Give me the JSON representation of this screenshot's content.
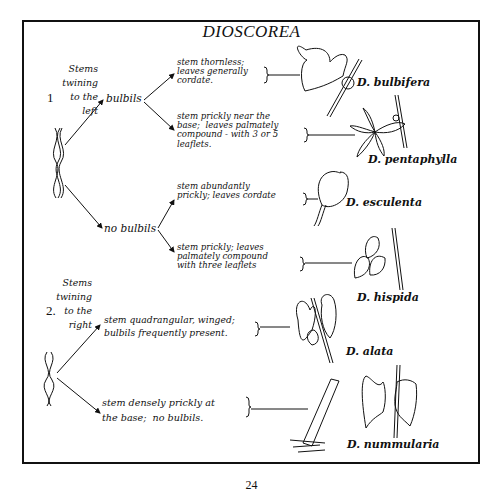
{
  "title": "DIOSCOREA",
  "page_number": "24",
  "groups": [
    {
      "number": "1",
      "heading": "Stems\ntwining\nto the\nleft",
      "branches": [
        {
          "node": "bulbils",
          "leaves": [
            {
              "description": "stem thornless;\nleaves generally\ncordate.",
              "species": "D. bulbifera"
            },
            {
              "description": "stem prickly near the\nbase;  leaves palmately\ncompound - with 3 or 5\nleaflets.",
              "species": "D. pentaphylla"
            }
          ]
        },
        {
          "node": "no bulbils",
          "leaves": [
            {
              "description": "stem abundantly\nprickly; leaves cordate",
              "species": "D. esculenta"
            },
            {
              "description": "stem prickly; leaves\npalmately compound\nwith three leaflets",
              "species": "D. hispida"
            }
          ]
        }
      ]
    },
    {
      "number": "2.",
      "heading": "Stems\ntwining\nto the\nright",
      "leaves": [
        {
          "description": "stem quadrangular, winged;\nbulbils frequently present.",
          "species": "D. alata"
        },
        {
          "description": "stem densely prickly at\nthe base;  no bulbils.",
          "species": "D. nummularia"
        }
      ]
    }
  ]
}
